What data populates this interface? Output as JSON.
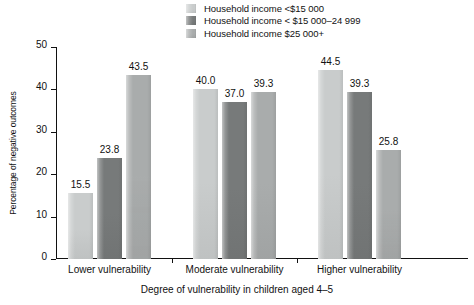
{
  "chart_data": {
    "type": "bar",
    "title": "",
    "subtitle": "",
    "xlabel": "Degree of vulnerability in children aged 4–5",
    "ylabel": "Percentage of negative outcomes",
    "categories": [
      "Lower vulnerability",
      "Moderate vulnerability",
      "Higher vulnerability"
    ],
    "series": [
      {
        "name": "Household income <$15 000",
        "color": "#c9cccc",
        "values": [
          15.5,
          40.0,
          44.5
        ],
        "labels": [
          "15.5",
          "40.0",
          "44.5"
        ]
      },
      {
        "name": "Household income < $15 000–24 999",
        "color": "#777a7a",
        "values": [
          23.8,
          37.0,
          39.3
        ],
        "labels": [
          "23.8",
          "37.0",
          "39.3"
        ]
      },
      {
        "name": "Household income $25 000+",
        "color": "#a9acac",
        "values": [
          43.5,
          39.3,
          25.8
        ],
        "labels": [
          "43.5",
          "39.3",
          "25.8"
        ]
      }
    ],
    "ylim": [
      0,
      50
    ],
    "yticks": [
      0,
      10,
      20,
      30,
      40,
      50
    ],
    "ytick_labels": [
      "0",
      "10",
      "20",
      "30",
      "40",
      "50"
    ],
    "grid": false,
    "legend_position": "top-center"
  },
  "legend": {
    "items": [
      {
        "label": "Household income <$15 000",
        "color": "#c9cccc"
      },
      {
        "label": "Household income < $15 000–24 999",
        "color": "#777a7a"
      },
      {
        "label": "Household income $25 000+",
        "color": "#a9acac"
      }
    ]
  },
  "axes": {
    "y_title": "Percentage of negative outcomes",
    "x_title": "Degree of vulnerability in children aged 4–5",
    "y_tick_labels": [
      "0",
      "10",
      "20",
      "30",
      "40",
      "50"
    ],
    "x_group_labels": [
      "Lower vulnerability",
      "Moderate vulnerability",
      "Higher vulnerability"
    ]
  }
}
